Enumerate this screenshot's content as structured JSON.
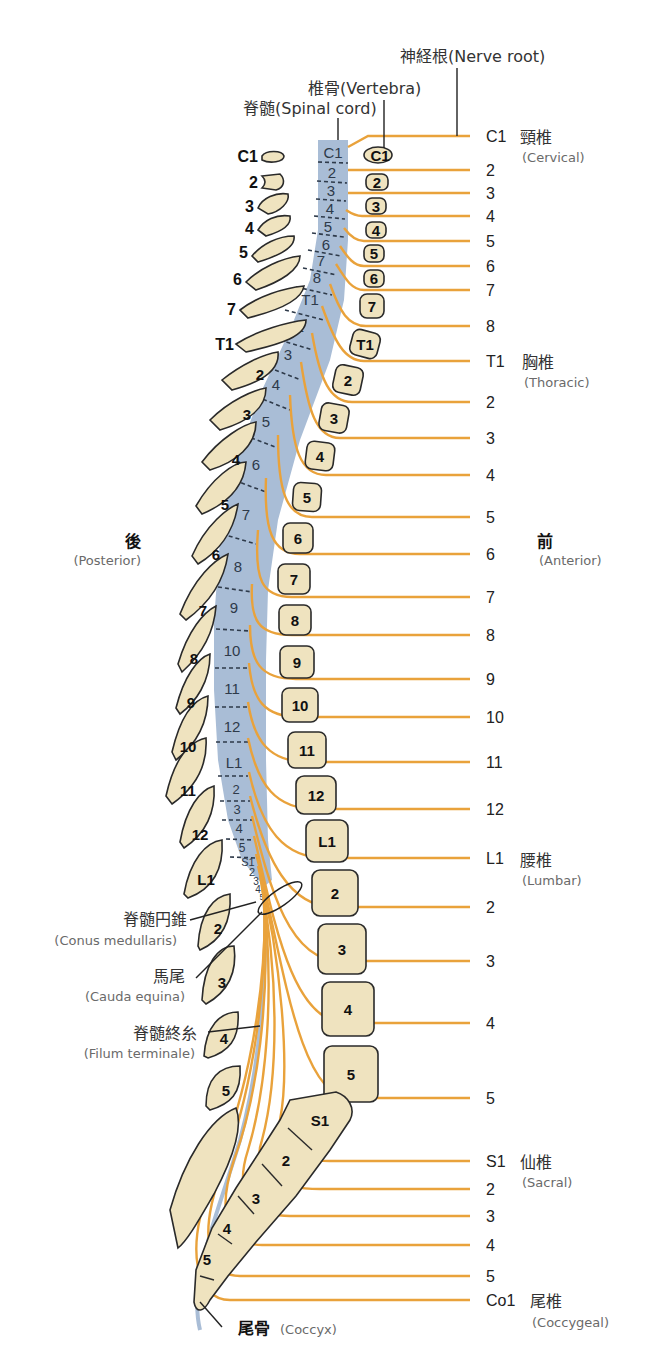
{
  "colors": {
    "spinal_cord": "#a9bdd6",
    "nerve": "#e9a23b",
    "bone": "#efe3bf",
    "outline": "#2a2a2a",
    "filum": "#a9bdd6"
  },
  "top_labels": {
    "nerve_root": "神経根(Nerve root)",
    "vertebra": "椎骨(Vertebra)",
    "spinal_cord": "脊髄(Spinal cord)"
  },
  "orientation": {
    "posterior_jp": "後",
    "posterior_en": "(Posterior)",
    "anterior_jp": "前",
    "anterior_en": "(Anterior)"
  },
  "regions": {
    "cervical_jp": "頸椎",
    "cervical_en": "(Cervical)",
    "thoracic_jp": "胸椎",
    "thoracic_en": "(Thoracic)",
    "lumbar_jp": "腰椎",
    "lumbar_en": "(Lumbar)",
    "sacral_jp": "仙椎",
    "sacral_en": "(Sacral)",
    "coccygeal_jp": "尾椎",
    "coccygeal_en": "(Coccygeal)"
  },
  "structure_labels": {
    "conus_jp": "脊髄円錐",
    "conus_en": "(Conus medullaris)",
    "cauda_jp": "馬尾",
    "cauda_en": "(Cauda equina)",
    "filum_jp": "脊髄終糸",
    "filum_en": "(Filum terminale)",
    "coccyx_jp": "尾骨",
    "coccyx_en": "(Coccyx)"
  },
  "nerve_roots": [
    {
      "label": "C1",
      "y": 136
    },
    {
      "label": "2",
      "y": 170
    },
    {
      "label": "3",
      "y": 193
    },
    {
      "label": "4",
      "y": 216
    },
    {
      "label": "5",
      "y": 241
    },
    {
      "label": "6",
      "y": 266
    },
    {
      "label": "7",
      "y": 290
    },
    {
      "label": "8",
      "y": 326
    },
    {
      "label": "T1",
      "y": 361
    },
    {
      "label": "2",
      "y": 402
    },
    {
      "label": "3",
      "y": 438
    },
    {
      "label": "4",
      "y": 475
    },
    {
      "label": "5",
      "y": 517
    },
    {
      "label": "6",
      "y": 554
    },
    {
      "label": "7",
      "y": 597
    },
    {
      "label": "8",
      "y": 635
    },
    {
      "label": "9",
      "y": 679
    },
    {
      "label": "10",
      "y": 717
    },
    {
      "label": "11",
      "y": 762
    },
    {
      "label": "12",
      "y": 809
    },
    {
      "label": "L1",
      "y": 858
    },
    {
      "label": "2",
      "y": 907
    },
    {
      "label": "3",
      "y": 961
    },
    {
      "label": "4",
      "y": 1023
    },
    {
      "label": "5",
      "y": 1098
    },
    {
      "label": "S1",
      "y": 1161
    },
    {
      "label": "2",
      "y": 1189
    },
    {
      "label": "3",
      "y": 1216
    },
    {
      "label": "4",
      "y": 1245
    },
    {
      "label": "5",
      "y": 1276
    },
    {
      "label": "Co1",
      "y": 1300
    }
  ],
  "spinal_cord_segments": [
    "C1",
    "2",
    "3",
    "4",
    "5",
    "6",
    "7",
    "8",
    "T1",
    "2",
    "3",
    "4",
    "5",
    "6",
    "7",
    "8",
    "9",
    "10",
    "11",
    "12",
    "L1",
    "2",
    "3",
    "4",
    "5",
    "S1",
    "2",
    "3",
    "4",
    "5"
  ],
  "vertebral_bodies": [
    {
      "label": "C1",
      "x": 378,
      "y": 155
    },
    {
      "label": "2",
      "x": 376,
      "y": 183
    },
    {
      "label": "3",
      "x": 375,
      "y": 206
    },
    {
      "label": "4",
      "x": 375,
      "y": 230
    },
    {
      "label": "5",
      "x": 373,
      "y": 254
    },
    {
      "label": "6",
      "x": 373,
      "y": 279
    },
    {
      "label": "7",
      "x": 372,
      "y": 306
    },
    {
      "label": "T1",
      "x": 365,
      "y": 344
    },
    {
      "label": "2",
      "x": 348,
      "y": 380
    },
    {
      "label": "3",
      "x": 334,
      "y": 418
    },
    {
      "label": "4",
      "x": 320,
      "y": 456
    },
    {
      "label": "5",
      "x": 307,
      "y": 497
    },
    {
      "label": "6",
      "x": 298,
      "y": 538
    },
    {
      "label": "7",
      "x": 294,
      "y": 579
    },
    {
      "label": "8",
      "x": 295,
      "y": 620
    },
    {
      "label": "9",
      "x": 297,
      "y": 662
    },
    {
      "label": "10",
      "x": 300,
      "y": 705
    },
    {
      "label": "11",
      "x": 306,
      "y": 750
    },
    {
      "label": "12",
      "x": 315,
      "y": 795
    },
    {
      "label": "L1",
      "x": 326,
      "y": 841
    },
    {
      "label": "2",
      "x": 335,
      "y": 893
    },
    {
      "label": "3",
      "x": 342,
      "y": 949
    },
    {
      "label": "4",
      "x": 348,
      "y": 1009
    },
    {
      "label": "5",
      "x": 350,
      "y": 1074
    }
  ],
  "posterior_processes": [
    {
      "label": "C1",
      "lx": 248,
      "ly": 158
    },
    {
      "label": "2",
      "lx": 255,
      "ly": 183
    },
    {
      "label": "3",
      "lx": 247,
      "ly": 208
    },
    {
      "label": "4",
      "lx": 247,
      "ly": 230
    },
    {
      "label": "5",
      "lx": 240,
      "ly": 255
    },
    {
      "label": "6",
      "lx": 236,
      "ly": 281
    },
    {
      "label": "7",
      "lx": 226,
      "ly": 310
    },
    {
      "label": "T1",
      "lx": 215,
      "ly": 344
    }
  ],
  "sacrum_labels": [
    "S1",
    "2",
    "3",
    "4",
    "5"
  ]
}
